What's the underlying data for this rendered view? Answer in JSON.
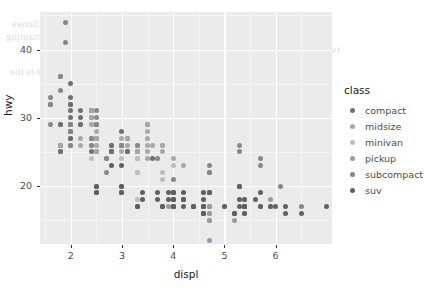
{
  "background_text": [
    {
      "text": "to make it so that we can lump together all of the classes",
      "x": 12,
      "y": 18
    },
    {
      "text": "in that group, which would then be compared to the remaining",
      "x": 6,
      "y": 31
    },
    {
      "text": "two cars.",
      "x": 300,
      "y": 44
    },
    {
      "text": "and the information on the front that we can see is the",
      "x": 10,
      "y": 66
    }
  ],
  "legend": {
    "title": "class",
    "items": [
      {
        "label": "compact",
        "color": "#707070"
      },
      {
        "label": "midsize",
        "color": "#a8a8a8"
      },
      {
        "label": "minivan",
        "color": "#bdbdbd"
      },
      {
        "label": "pickup",
        "color": "#9a9a9a"
      },
      {
        "label": "subcompact",
        "color": "#878787"
      },
      {
        "label": "suv",
        "color": "#606060"
      }
    ]
  },
  "axes": {
    "x": {
      "label": "displ",
      "ticks": [
        2,
        3,
        4,
        5,
        6
      ],
      "tick_labels": [
        "2",
        "3",
        "4",
        "5",
        "6"
      ],
      "minor_ticks": [
        1.5,
        2.5,
        3.5,
        4.5,
        5.5,
        6.5
      ],
      "range": [
        1.4,
        7.1
      ]
    },
    "y": {
      "label": "hwy",
      "ticks": [
        20,
        30,
        40
      ],
      "tick_labels": [
        "20",
        "30",
        "40"
      ],
      "minor_ticks": [
        15,
        25,
        35,
        45
      ],
      "range": [
        11.5,
        45.5
      ]
    }
  },
  "chart_data": {
    "type": "scatter",
    "title": "",
    "xlabel": "displ",
    "ylabel": "hwy",
    "xlim": [
      1.4,
      7.1
    ],
    "ylim": [
      11.5,
      45.5
    ],
    "grid": true,
    "legend_position": "right",
    "legend_title": "class",
    "series": [
      {
        "name": "compact",
        "color": "#707070",
        "points": [
          [
            1.8,
            29
          ],
          [
            1.8,
            29
          ],
          [
            2.0,
            31
          ],
          [
            2.0,
            30
          ],
          [
            2.8,
            26
          ],
          [
            2.8,
            26
          ],
          [
            3.1,
            27
          ],
          [
            1.8,
            26
          ],
          [
            1.8,
            25
          ],
          [
            2.0,
            28
          ],
          [
            2.0,
            27
          ],
          [
            2.8,
            25
          ],
          [
            2.8,
            25
          ],
          [
            3.1,
            25
          ],
          [
            3.1,
            25
          ],
          [
            2.4,
            27
          ],
          [
            2.4,
            25
          ],
          [
            2.5,
            27
          ],
          [
            2.5,
            25
          ],
          [
            3.3,
            25
          ],
          [
            2.0,
            33
          ],
          [
            2.0,
            35
          ],
          [
            2.0,
            32
          ],
          [
            2.0,
            32
          ],
          [
            2.5,
            29
          ],
          [
            2.5,
            27
          ],
          [
            2.2,
            29
          ],
          [
            2.2,
            29
          ],
          [
            2.4,
            31
          ],
          [
            2.4,
            31
          ],
          [
            3.0,
            26
          ],
          [
            3.0,
            26
          ],
          [
            3.5,
            29
          ],
          [
            2.2,
            30
          ],
          [
            2.2,
            31
          ],
          [
            2.4,
            31
          ],
          [
            2.4,
            30
          ],
          [
            3.0,
            28
          ],
          [
            3.0,
            26
          ],
          [
            3.3,
            25
          ],
          [
            1.8,
            26
          ],
          [
            1.8,
            25
          ],
          [
            2.0,
            28
          ],
          [
            2.0,
            27
          ],
          [
            2.8,
            25
          ],
          [
            2.8,
            25
          ],
          [
            3.6,
            24
          ]
        ]
      },
      {
        "name": "midsize",
        "color": "#a8a8a8",
        "points": [
          [
            2.4,
            27
          ],
          [
            3.0,
            26
          ],
          [
            3.0,
            25
          ],
          [
            3.5,
            29
          ],
          [
            2.4,
            31
          ],
          [
            2.4,
            30
          ],
          [
            3.0,
            26
          ],
          [
            3.0,
            26
          ],
          [
            3.3,
            25
          ],
          [
            2.4,
            27
          ],
          [
            2.4,
            26
          ],
          [
            3.1,
            26
          ],
          [
            3.5,
            27
          ],
          [
            3.6,
            26
          ],
          [
            2.4,
            29
          ],
          [
            2.4,
            29
          ],
          [
            3.1,
            27
          ],
          [
            3.3,
            25
          ],
          [
            3.3,
            24
          ],
          [
            3.3,
            25
          ],
          [
            3.3,
            26
          ],
          [
            3.8,
            26
          ],
          [
            3.8,
            26
          ],
          [
            4.0,
            24
          ],
          [
            1.8,
            26
          ],
          [
            3.0,
            27
          ],
          [
            3.5,
            28
          ],
          [
            3.8,
            25
          ],
          [
            5.3,
            20
          ],
          [
            2.5,
            28
          ],
          [
            2.5,
            27
          ],
          [
            2.5,
            26
          ],
          [
            2.5,
            25
          ],
          [
            2.5,
            29
          ],
          [
            2.5,
            27
          ],
          [
            3.5,
            25
          ],
          [
            3.5,
            24
          ],
          [
            3.5,
            26
          ],
          [
            4.2,
            23
          ],
          [
            2.2,
            26
          ],
          [
            2.2,
            27
          ]
        ]
      },
      {
        "name": "minivan",
        "color": "#bdbdbd",
        "points": [
          [
            2.4,
            24
          ],
          [
            3.0,
            24
          ],
          [
            3.3,
            22
          ],
          [
            3.3,
            22
          ],
          [
            3.3,
            24
          ],
          [
            3.3,
            24
          ],
          [
            3.3,
            17
          ],
          [
            3.8,
            22
          ],
          [
            3.8,
            21
          ],
          [
            4.0,
            23
          ],
          [
            3.3,
            18
          ],
          [
            3.8,
            17
          ]
        ]
      },
      {
        "name": "pickup",
        "color": "#9a9a9a",
        "points": [
          [
            4.0,
            19
          ],
          [
            4.7,
            17
          ],
          [
            4.7,
            17
          ],
          [
            4.7,
            12
          ],
          [
            5.7,
            17
          ],
          [
            5.9,
            17
          ],
          [
            4.7,
            16
          ],
          [
            5.2,
            15
          ],
          [
            5.2,
            16
          ],
          [
            3.9,
            17
          ],
          [
            4.7,
            15
          ],
          [
            4.7,
            15
          ],
          [
            4.7,
            16
          ],
          [
            5.2,
            16
          ],
          [
            5.9,
            18
          ],
          [
            4.0,
            18
          ],
          [
            4.0,
            17
          ],
          [
            4.0,
            18
          ],
          [
            4.6,
            16
          ],
          [
            5.0,
            17
          ],
          [
            4.2,
            18
          ],
          [
            4.2,
            18
          ],
          [
            4.6,
            17
          ],
          [
            4.6,
            17
          ],
          [
            4.6,
            17
          ],
          [
            5.4,
            16
          ],
          [
            5.4,
            17
          ],
          [
            5.4,
            18
          ],
          [
            4.0,
            17
          ],
          [
            4.0,
            18
          ],
          [
            4.6,
            17
          ],
          [
            4.6,
            19
          ],
          [
            5.4,
            16
          ]
        ]
      },
      {
        "name": "subcompact",
        "color": "#878787",
        "points": [
          [
            1.6,
            33
          ],
          [
            1.6,
            32
          ],
          [
            1.6,
            32
          ],
          [
            1.6,
            29
          ],
          [
            1.6,
            32
          ],
          [
            1.8,
            34
          ],
          [
            1.8,
            36
          ],
          [
            1.8,
            36
          ],
          [
            2.0,
            29
          ],
          [
            2.4,
            26
          ],
          [
            2.4,
            27
          ],
          [
            2.5,
            30
          ],
          [
            2.5,
            31
          ],
          [
            3.3,
            26
          ],
          [
            2.0,
            28
          ],
          [
            2.0,
            26
          ],
          [
            2.0,
            29
          ],
          [
            2.0,
            28
          ],
          [
            2.7,
            24
          ],
          [
            2.7,
            24
          ],
          [
            2.7,
            22
          ],
          [
            3.0,
            26
          ],
          [
            3.7,
            24
          ],
          [
            4.0,
            21
          ],
          [
            4.7,
            22
          ],
          [
            4.7,
            23
          ],
          [
            4.7,
            22
          ],
          [
            5.7,
            23
          ],
          [
            6.1,
            20
          ],
          [
            5.3,
            25
          ],
          [
            5.3,
            26
          ],
          [
            5.7,
            24
          ],
          [
            6.5,
            17
          ],
          [
            1.9,
            44
          ],
          [
            2.0,
            29
          ],
          [
            2.0,
            26
          ],
          [
            2.0,
            29
          ],
          [
            2.0,
            29
          ],
          [
            2.5,
            29
          ],
          [
            2.5,
            29
          ],
          [
            1.9,
            41
          ]
        ]
      },
      {
        "name": "suv",
        "color": "#606060",
        "points": [
          [
            4.6,
            19
          ],
          [
            5.4,
            17
          ],
          [
            5.4,
            17
          ],
          [
            4.0,
            17
          ],
          [
            4.0,
            19
          ],
          [
            4.0,
            19
          ],
          [
            4.6,
            17
          ],
          [
            5.0,
            17
          ],
          [
            4.2,
            17
          ],
          [
            4.2,
            18
          ],
          [
            4.4,
            17
          ],
          [
            4.4,
            17
          ],
          [
            4.6,
            16
          ],
          [
            5.4,
            16
          ],
          [
            5.4,
            17
          ],
          [
            3.8,
            17
          ],
          [
            3.8,
            17
          ],
          [
            4.0,
            17
          ],
          [
            4.0,
            17
          ],
          [
            4.6,
            16
          ],
          [
            4.6,
            16
          ],
          [
            5.4,
            17
          ],
          [
            5.4,
            17
          ],
          [
            2.5,
            19
          ],
          [
            2.5,
            20
          ],
          [
            2.5,
            20
          ],
          [
            2.5,
            19
          ],
          [
            3.0,
            20
          ],
          [
            3.0,
            20
          ],
          [
            3.0,
            19
          ],
          [
            3.0,
            19
          ],
          [
            3.3,
            17
          ],
          [
            3.3,
            17
          ],
          [
            3.4,
            19
          ],
          [
            3.4,
            18
          ],
          [
            3.7,
            18
          ],
          [
            3.7,
            19
          ],
          [
            3.9,
            19
          ],
          [
            3.9,
            18
          ],
          [
            4.0,
            18
          ],
          [
            4.0,
            18
          ],
          [
            4.2,
            18
          ],
          [
            4.7,
            19
          ],
          [
            4.7,
            19
          ],
          [
            4.7,
            19
          ],
          [
            5.2,
            16
          ],
          [
            5.2,
            16
          ],
          [
            5.7,
            17
          ],
          [
            5.9,
            17
          ],
          [
            4.6,
            18
          ],
          [
            5.4,
            18
          ],
          [
            2.8,
            23
          ],
          [
            3.0,
            23
          ],
          [
            4.0,
            19
          ],
          [
            4.2,
            19
          ],
          [
            4.4,
            17
          ],
          [
            4.6,
            17
          ],
          [
            5.3,
            17
          ],
          [
            5.3,
            18
          ],
          [
            5.6,
            18
          ],
          [
            6.0,
            17
          ],
          [
            6.2,
            16
          ],
          [
            6.2,
            17
          ],
          [
            7.0,
            17
          ],
          [
            5.3,
            20
          ],
          [
            5.3,
            20
          ],
          [
            5.7,
            19
          ],
          [
            6.5,
            16
          ]
        ]
      }
    ]
  },
  "style": {
    "panel_background": "#ebebeb",
    "grid_major_color": "#ffffff",
    "grid_minor_color": "#f5f5f5",
    "text_color": "#4d4d4d",
    "title_color": "#1a1a1a"
  }
}
